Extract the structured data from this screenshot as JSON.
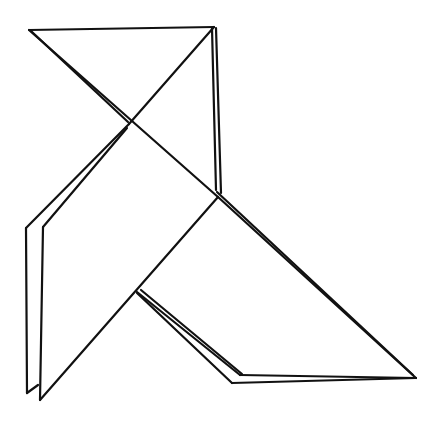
{
  "image": {
    "description": "Line drawing of a folded-paper (origami) bird",
    "stroke_color": "#111111",
    "background": "#ffffff"
  }
}
